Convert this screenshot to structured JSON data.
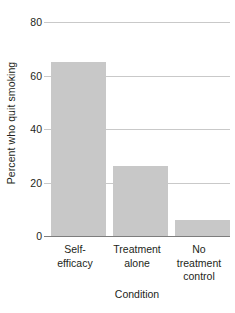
{
  "chart_data": {
    "type": "bar",
    "title": "",
    "subtitle": "",
    "xlabel": "Condition",
    "ylabel": "Percent who quit smoking",
    "categories": [
      "Self-\nefficacy",
      "Treatment\nalone",
      "No\ntreatment\ncontrol"
    ],
    "category_labels": [
      [
        "Self-",
        "efficacy"
      ],
      [
        "Treatment",
        "alone"
      ],
      [
        "No",
        "treatment",
        "control"
      ]
    ],
    "values": [
      65,
      26,
      6
    ],
    "ylim": [
      0,
      80
    ],
    "yticks": [
      0,
      20,
      40,
      60,
      80
    ],
    "ytick_labels": [
      "0",
      "20",
      "40",
      "60",
      "80"
    ],
    "grid": "horizontal",
    "legend": "none",
    "bar_color": "#c8c8c8",
    "gridline_color": "#c9c9c9",
    "axis_color": "#7d7d7d",
    "text_color": "#231f20"
  }
}
